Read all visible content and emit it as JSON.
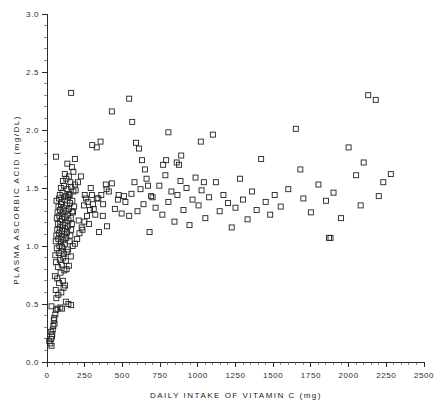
{
  "chart_data": {
    "type": "scatter",
    "title": "",
    "xlabel": "DAILY INTAKE OF VITAMIN C  (mg)",
    "ylabel": "PLASMA ASCORBIC ACID (mg/DL)",
    "xlim": [
      0,
      2500
    ],
    "ylim": [
      0.0,
      3.0
    ],
    "xticks": [
      0,
      250,
      500,
      750,
      1000,
      1250,
      1500,
      1750,
      2000,
      2250,
      2500
    ],
    "xtick_labels": [
      "0",
      "250",
      "500",
      "750",
      "1000",
      "1250",
      "1500",
      "1750",
      "2000",
      "2250",
      "2500"
    ],
    "yticks": [
      0.0,
      0.5,
      1.0,
      1.5,
      2.0,
      2.5,
      3.0
    ],
    "ytick_labels": [
      "0.0",
      "0.5",
      "1.0",
      "1.5",
      "2.0",
      "2.5",
      "3.0"
    ],
    "x_minor_interval": 50,
    "y_minor_interval": 0.1,
    "grid": false,
    "legend": "none",
    "marker": "open-square",
    "marker_size": 5,
    "marker_color": "#232323",
    "n_points": 232,
    "points": [
      [
        15,
        0.18
      ],
      [
        22,
        0.16
      ],
      [
        28,
        0.2
      ],
      [
        30,
        0.14
      ],
      [
        33,
        0.22
      ],
      [
        25,
        0.26
      ],
      [
        38,
        0.28
      ],
      [
        42,
        0.31
      ],
      [
        35,
        0.24
      ],
      [
        45,
        0.36
      ],
      [
        50,
        0.33
      ],
      [
        55,
        0.41
      ],
      [
        48,
        0.38
      ],
      [
        60,
        0.45
      ],
      [
        30,
        0.48
      ],
      [
        70,
        0.46
      ],
      [
        88,
        0.47
      ],
      [
        100,
        0.46
      ],
      [
        62,
        0.55
      ],
      [
        75,
        0.58
      ],
      [
        58,
        0.62
      ],
      [
        95,
        0.6
      ],
      [
        110,
        0.64
      ],
      [
        80,
        0.68
      ],
      [
        68,
        0.72
      ],
      [
        105,
        0.7
      ],
      [
        120,
        0.66
      ],
      [
        52,
        0.74
      ],
      [
        90,
        0.77
      ],
      [
        115,
        0.79
      ],
      [
        72,
        0.82
      ],
      [
        98,
        0.84
      ],
      [
        130,
        0.8
      ],
      [
        60,
        0.86
      ],
      [
        85,
        0.88
      ],
      [
        108,
        0.9
      ],
      [
        125,
        0.87
      ],
      [
        145,
        0.83
      ],
      [
        55,
        0.92
      ],
      [
        78,
        0.94
      ],
      [
        95,
        0.96
      ],
      [
        112,
        0.93
      ],
      [
        135,
        0.95
      ],
      [
        158,
        0.91
      ],
      [
        65,
        0.98
      ],
      [
        82,
        1.0
      ],
      [
        100,
        0.99
      ],
      [
        118,
        1.02
      ],
      [
        140,
        0.97
      ],
      [
        170,
        1.0
      ],
      [
        58,
        1.04
      ],
      [
        75,
        1.06
      ],
      [
        92,
        1.03
      ],
      [
        108,
        1.05
      ],
      [
        128,
        1.07
      ],
      [
        150,
        1.04
      ],
      [
        185,
        1.02
      ],
      [
        62,
        1.09
      ],
      [
        80,
        1.11
      ],
      [
        97,
        1.08
      ],
      [
        115,
        1.1
      ],
      [
        133,
        1.12
      ],
      [
        155,
        1.09
      ],
      [
        200,
        1.06
      ],
      [
        68,
        1.14
      ],
      [
        85,
        1.16
      ],
      [
        102,
        1.13
      ],
      [
        120,
        1.15
      ],
      [
        138,
        1.17
      ],
      [
        160,
        1.14
      ],
      [
        215,
        1.11
      ],
      [
        72,
        1.19
      ],
      [
        88,
        1.21
      ],
      [
        105,
        1.18
      ],
      [
        122,
        1.2
      ],
      [
        142,
        1.22
      ],
      [
        165,
        1.19
      ],
      [
        230,
        1.16
      ],
      [
        65,
        1.24
      ],
      [
        82,
        1.26
      ],
      [
        99,
        1.23
      ],
      [
        117,
        1.25
      ],
      [
        136,
        1.27
      ],
      [
        158,
        1.24
      ],
      [
        248,
        1.21
      ],
      [
        70,
        1.29
      ],
      [
        87,
        1.31
      ],
      [
        104,
        1.28
      ],
      [
        124,
        1.3
      ],
      [
        146,
        1.32
      ],
      [
        172,
        1.29
      ],
      [
        265,
        1.26
      ],
      [
        76,
        1.34
      ],
      [
        93,
        1.36
      ],
      [
        110,
        1.33
      ],
      [
        130,
        1.35
      ],
      [
        152,
        1.37
      ],
      [
        180,
        1.34
      ],
      [
        285,
        1.31
      ],
      [
        63,
        1.39
      ],
      [
        80,
        1.41
      ],
      [
        98,
        1.38
      ],
      [
        118,
        1.4
      ],
      [
        140,
        1.42
      ],
      [
        168,
        1.39
      ],
      [
        305,
        1.36
      ],
      [
        85,
        1.44
      ],
      [
        103,
        1.46
      ],
      [
        125,
        1.43
      ],
      [
        148,
        1.45
      ],
      [
        175,
        1.47
      ],
      [
        330,
        1.41
      ],
      [
        92,
        1.5
      ],
      [
        112,
        1.52
      ],
      [
        135,
        1.49
      ],
      [
        160,
        1.51
      ],
      [
        190,
        1.48
      ],
      [
        360,
        1.44
      ],
      [
        105,
        1.56
      ],
      [
        128,
        1.58
      ],
      [
        155,
        1.55
      ],
      [
        185,
        1.53
      ],
      [
        395,
        1.49
      ],
      [
        118,
        1.62
      ],
      [
        145,
        1.6
      ],
      [
        175,
        1.64
      ],
      [
        430,
        1.54
      ],
      [
        60,
        1.77
      ],
      [
        135,
        1.71
      ],
      [
        165,
        1.68
      ],
      [
        470,
        1.4
      ],
      [
        160,
        2.32
      ],
      [
        510,
        1.43
      ],
      [
        545,
        1.26
      ],
      [
        560,
        1.45
      ],
      [
        580,
        1.55
      ],
      [
        600,
        1.3
      ],
      [
        620,
        1.49
      ],
      [
        640,
        1.36
      ],
      [
        660,
        1.58
      ],
      [
        300,
        1.87
      ],
      [
        330,
        1.85
      ],
      [
        355,
        1.9
      ],
      [
        680,
        1.12
      ],
      [
        700,
        1.42
      ],
      [
        720,
        1.33
      ],
      [
        745,
        1.52
      ],
      [
        765,
        1.27
      ],
      [
        785,
        1.61
      ],
      [
        805,
        1.38
      ],
      [
        430,
        2.16
      ],
      [
        825,
        1.47
      ],
      [
        845,
        1.21
      ],
      [
        865,
        1.44
      ],
      [
        885,
        1.56
      ],
      [
        905,
        1.31
      ],
      [
        925,
        1.5
      ],
      [
        945,
        1.18
      ],
      [
        965,
        1.4
      ],
      [
        985,
        1.59
      ],
      [
        390,
        1.53
      ],
      [
        410,
        1.47
      ],
      [
        450,
        1.32
      ],
      [
        475,
        1.44
      ],
      [
        495,
        1.28
      ],
      [
        520,
        1.38
      ],
      [
        250,
        1.44
      ],
      [
        270,
        1.38
      ],
      [
        290,
        1.5
      ],
      [
        310,
        1.32
      ],
      [
        340,
        1.41
      ],
      [
        370,
        1.26
      ],
      [
        1005,
        1.35
      ],
      [
        1025,
        1.48
      ],
      [
        1050,
        1.24
      ],
      [
        1075,
        1.42
      ],
      [
        1100,
        1.96
      ],
      [
        1120,
        1.55
      ],
      [
        1145,
        1.3
      ],
      [
        1170,
        1.44
      ],
      [
        1200,
        1.37
      ],
      [
        1225,
        1.16
      ],
      [
        1250,
        1.33
      ],
      [
        545,
        2.27
      ],
      [
        565,
        2.07
      ],
      [
        590,
        1.89
      ],
      [
        610,
        1.84
      ],
      [
        630,
        1.74
      ],
      [
        650,
        1.66
      ],
      [
        670,
        1.52
      ],
      [
        690,
        1.43
      ],
      [
        1280,
        1.58
      ],
      [
        1300,
        1.4
      ],
      [
        1330,
        1.23
      ],
      [
        1360,
        1.47
      ],
      [
        1390,
        1.31
      ],
      [
        1420,
        1.75
      ],
      [
        1450,
        1.38
      ],
      [
        860,
        1.72
      ],
      [
        875,
        1.7
      ],
      [
        890,
        1.78
      ],
      [
        1480,
        1.27
      ],
      [
        1510,
        1.44
      ],
      [
        1550,
        1.34
      ],
      [
        1600,
        1.49
      ],
      [
        1650,
        2.01
      ],
      [
        1680,
        1.66
      ],
      [
        1700,
        1.41
      ],
      [
        1750,
        1.29
      ],
      [
        1800,
        1.53
      ],
      [
        1850,
        1.39
      ],
      [
        1870,
        1.07
      ],
      [
        1880,
        1.07
      ],
      [
        1900,
        1.46
      ],
      [
        1950,
        1.24
      ],
      [
        2000,
        1.85
      ],
      [
        2050,
        1.61
      ],
      [
        2080,
        1.35
      ],
      [
        2100,
        1.72
      ],
      [
        2130,
        2.3
      ],
      [
        2180,
        2.26
      ],
      [
        2200,
        1.43
      ],
      [
        2230,
        1.55
      ],
      [
        2280,
        1.62
      ],
      [
        770,
        1.7
      ],
      [
        790,
        1.74
      ],
      [
        1020,
        1.9
      ],
      [
        1040,
        1.55
      ],
      [
        805,
        1.98
      ],
      [
        185,
        1.75
      ],
      [
        205,
        1.55
      ],
      [
        225,
        1.6
      ],
      [
        245,
        1.35
      ],
      [
        150,
        1.44
      ],
      [
        168,
        1.3
      ],
      [
        210,
        1.22
      ],
      [
        235,
        1.14
      ],
      [
        258,
        1.41
      ],
      [
        278,
        1.19
      ],
      [
        298,
        1.44
      ],
      [
        320,
        1.27
      ],
      [
        345,
        1.12
      ],
      [
        372,
        1.36
      ],
      [
        398,
        1.17
      ],
      [
        125,
        0.52
      ],
      [
        142,
        0.5
      ],
      [
        160,
        0.49
      ]
    ]
  }
}
